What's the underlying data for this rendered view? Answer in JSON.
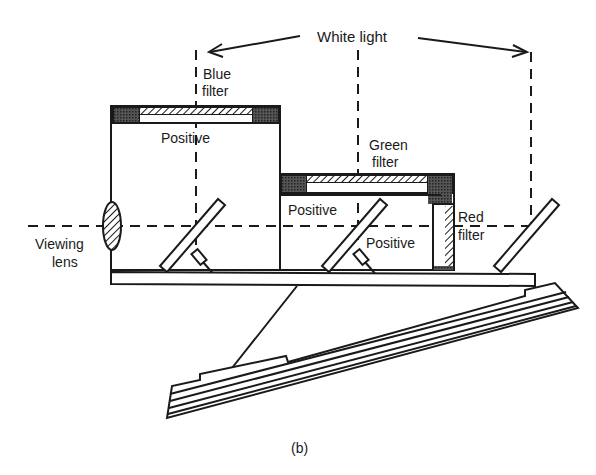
{
  "diagram": {
    "type": "optical-schematic",
    "caption": "(b)",
    "labels": {
      "white_light": "White light",
      "blue_filter_1": "Blue",
      "blue_filter_2": "filter",
      "green_filter_1": "Green",
      "green_filter_2": "filter",
      "red_filter_1": "Red",
      "red_filter_2": "filter",
      "positive_top": "Positive",
      "positive_middle": "Positive",
      "positive_right": "Positive",
      "viewing_lens_1": "Viewing",
      "viewing_lens_2": "lens"
    },
    "components": [
      {
        "name": "blue-filter-box",
        "label": "Blue filter + Positive"
      },
      {
        "name": "green-filter-box",
        "label": "Green filter + Positive"
      },
      {
        "name": "red-filter-panel",
        "label": "Red filter + Positive"
      },
      {
        "name": "viewing-lens",
        "label": "Viewing lens"
      },
      {
        "name": "mirror-1"
      },
      {
        "name": "mirror-2"
      },
      {
        "name": "mirror-3"
      },
      {
        "name": "base-plate"
      },
      {
        "name": "folding-stand"
      }
    ],
    "colors": {
      "ink": "#1a1a1a",
      "background": "#ffffff"
    }
  }
}
